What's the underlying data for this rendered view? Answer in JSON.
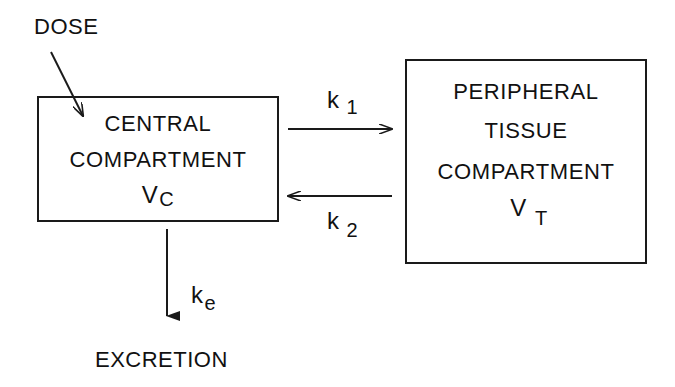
{
  "diagram": {
    "type": "two-compartment pharmacokinetic model",
    "input": {
      "label": "DOSE"
    },
    "central": {
      "line1": "CENTRAL",
      "line2": "COMPARTMENT",
      "volume_symbol": "V",
      "volume_subscript": "C"
    },
    "peripheral": {
      "line1": "PERIPHERAL",
      "line2": "TISSUE",
      "line3": "COMPARTMENT",
      "volume_symbol": "V",
      "volume_subscript": "T"
    },
    "rates": {
      "k1": {
        "symbol": "k",
        "subscript": "1",
        "direction": "central → peripheral"
      },
      "k2": {
        "symbol": "k",
        "subscript": "2",
        "direction": "peripheral → central"
      },
      "ke": {
        "symbol": "k",
        "subscript": "e",
        "direction": "central → excretion"
      }
    },
    "output": {
      "label": "EXCRETION"
    },
    "colors": {
      "ink": "#1a1a1a",
      "background": "#ffffff"
    }
  }
}
